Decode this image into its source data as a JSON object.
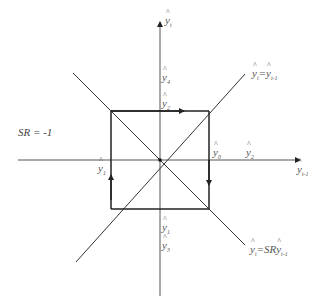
{
  "diagram": {
    "type": "phase-diagram",
    "stroke_color": "#333333",
    "axis_color": "#555555",
    "square_color": "#222222",
    "sr_label": "SR = -1",
    "axes": {
      "y_axis": {
        "var": "y",
        "sub": "t"
      },
      "x_axis": {
        "var": "y",
        "sub": "t-1"
      }
    },
    "lines": {
      "identity": {
        "lhs_var": "y",
        "lhs_sub": "t",
        "eq": "=",
        "rhs_var": "y",
        "rhs_sub": "t-1"
      },
      "sr_line": {
        "lhs_var": "y",
        "lhs_sub": "t",
        "eq": "=SR",
        "rhs_var": "y",
        "rhs_sub": "t-1"
      }
    },
    "points": {
      "y4_top": {
        "var": "y",
        "sub": "4"
      },
      "y2_top": {
        "var": "y",
        "sub": "2"
      },
      "y0_right": {
        "var": "y",
        "sub": "0"
      },
      "y2_right": {
        "var": "y",
        "sub": "2"
      },
      "y1_left": {
        "var": "y",
        "sub": "1"
      },
      "y1_bottom": {
        "var": "y",
        "sub": "1"
      },
      "y3_bottom": {
        "var": "y",
        "sub": "3"
      }
    }
  }
}
